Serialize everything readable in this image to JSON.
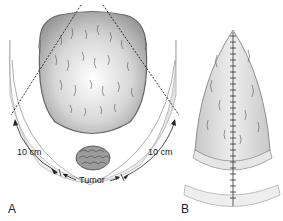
{
  "panels": [
    {
      "id": "A",
      "label": "A",
      "annotations": {
        "left_distance": "10 cm",
        "right_distance": "10 cm",
        "tumor": "Tumor"
      },
      "description": "Wide excision outline with dashed incision lines extending 10 cm on each side of tumor"
    },
    {
      "id": "B",
      "label": "B",
      "description": "Closed wound with vertical sutured incision line"
    }
  ],
  "colors": {
    "skin_light": "#f2f2f2",
    "skin_mid": "#d9d9d9",
    "skin_dark": "#a8a8a8",
    "outline": "#555555",
    "dashed": "#222222",
    "text": "#222222"
  }
}
